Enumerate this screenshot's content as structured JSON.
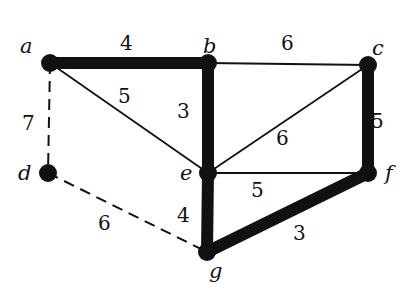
{
  "diagram": {
    "type": "weighted-graph-spanning-tree",
    "nodes": [
      {
        "id": "a",
        "label": "a",
        "x": 50,
        "y": 63,
        "lx": 20,
        "ly": 53
      },
      {
        "id": "b",
        "label": "b",
        "x": 208,
        "y": 63,
        "lx": 203,
        "ly": 53
      },
      {
        "id": "c",
        "label": "c",
        "x": 368,
        "y": 65,
        "lx": 372,
        "ly": 55
      },
      {
        "id": "d",
        "label": "d",
        "x": 48,
        "y": 173,
        "lx": 18,
        "ly": 180
      },
      {
        "id": "e",
        "label": "e",
        "x": 208,
        "y": 173,
        "lx": 180,
        "ly": 180
      },
      {
        "id": "f",
        "label": "f",
        "x": 368,
        "y": 173,
        "lx": 385,
        "ly": 180
      },
      {
        "id": "g",
        "label": "g",
        "x": 207,
        "y": 252,
        "lx": 209,
        "ly": 278
      }
    ],
    "edges": [
      {
        "from": "a",
        "to": "b",
        "weight": "4",
        "style": "tree",
        "lx": 120,
        "ly": 50
      },
      {
        "from": "b",
        "to": "c",
        "weight": "6",
        "style": "normal",
        "lx": 281,
        "ly": 50
      },
      {
        "from": "a",
        "to": "e",
        "weight": "5",
        "style": "normal",
        "lx": 118,
        "ly": 103
      },
      {
        "from": "b",
        "to": "e",
        "weight": "3",
        "style": "tree",
        "lx": 177,
        "ly": 118
      },
      {
        "from": "c",
        "to": "e",
        "weight": "6",
        "style": "normal",
        "lx": 276,
        "ly": 145
      },
      {
        "from": "c",
        "to": "f",
        "weight": "5",
        "style": "tree",
        "lx": 371,
        "ly": 128
      },
      {
        "from": "e",
        "to": "f",
        "weight": "5",
        "style": "normal",
        "lx": 251,
        "ly": 197
      },
      {
        "from": "a",
        "to": "d",
        "weight": "7",
        "style": "dashed",
        "lx": 22,
        "ly": 130
      },
      {
        "from": "d",
        "to": "g",
        "weight": "6",
        "style": "dashed",
        "lx": 98,
        "ly": 230
      },
      {
        "from": "e",
        "to": "g",
        "weight": "4",
        "style": "tree",
        "lx": 177,
        "ly": 222
      },
      {
        "from": "g",
        "to": "f",
        "weight": "3",
        "style": "tree",
        "lx": 293,
        "ly": 240
      }
    ]
  }
}
